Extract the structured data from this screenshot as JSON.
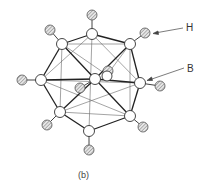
{
  "figure": {
    "caption": "(b)",
    "labels": {
      "hydrogen": "H",
      "boron": "B"
    },
    "colors": {
      "line": "#333333",
      "boron_fill": "#ffffff",
      "hydrogen_fill": "#bdbdbd"
    }
  }
}
